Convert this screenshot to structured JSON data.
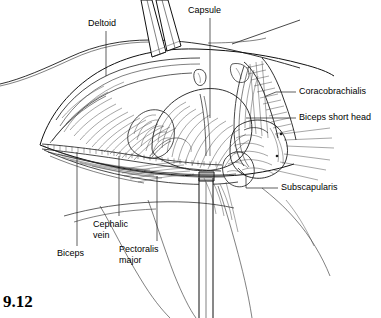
{
  "figure": {
    "number": "9.12",
    "kind": "anatomical-line-drawing",
    "background_color": "#ffffff",
    "ink_color": "#1a1a1a"
  },
  "labels": [
    {
      "id": "deltoid",
      "text": "Deltoid",
      "position": "top-left",
      "x": 88,
      "y": 22,
      "leader": "vertical-down"
    },
    {
      "id": "capsule",
      "text": "Capsule",
      "position": "top-center",
      "x": 188,
      "y": 8,
      "leader": "vertical-down"
    },
    {
      "id": "coracobrachialis",
      "text": "Coracobrachialis",
      "position": "right-upper",
      "x": 299,
      "y": 88,
      "leader": "horizontal-left-elbow"
    },
    {
      "id": "biceps-short-head",
      "text": "Biceps short head",
      "position": "right-middle",
      "x": 299,
      "y": 114,
      "leader": "horizontal-left"
    },
    {
      "id": "subscapularis",
      "text": "Subscapularis",
      "position": "right-lower",
      "x": 280,
      "y": 184,
      "leader": "horizontal-left-elbow-up"
    },
    {
      "id": "biceps",
      "text": "Biceps",
      "position": "bottom-left",
      "x": 56,
      "y": 251,
      "leader": "vertical-up"
    },
    {
      "id": "cephalic-vein",
      "text": "Cephalic\nvein",
      "position": "bottom-center-left",
      "x": 92,
      "y": 222,
      "leader": "vertical-up"
    },
    {
      "id": "pectoralis-major",
      "text": "Pectoralis\nmajor",
      "position": "bottom-center",
      "x": 118,
      "y": 247,
      "leader": "vertical-up"
    }
  ],
  "structures": [
    {
      "id": "retractor-superior",
      "name": "superior retractor blade"
    },
    {
      "id": "retractor-inferior",
      "name": "inferior retractor blade"
    },
    {
      "id": "cephalic-vein-vessel",
      "name": "cephalic vein with tributaries"
    },
    {
      "id": "humeral-head-capsule",
      "name": "joint capsule over humeral head"
    },
    {
      "id": "conjoint-tendon",
      "name": "coracobrachialis and biceps short head"
    },
    {
      "id": "subscapularis-muscle",
      "name": "subscapularis muscle belly"
    },
    {
      "id": "skin-edge-superior",
      "name": "retracted skin / fascial edge"
    },
    {
      "id": "arm-contour",
      "name": "arm contour lines"
    }
  ]
}
